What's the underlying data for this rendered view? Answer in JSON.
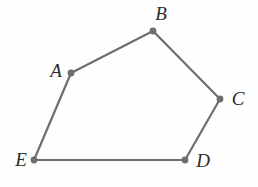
{
  "figure": {
    "type": "geometric-diagram",
    "shape_name": "pentagon",
    "background_color": "#fefefe",
    "stroke_color": "#6e6e6e",
    "vertex_dot_color": "#6e6e6e",
    "label_color": "#2b2b2b",
    "stroke_width": 2.2,
    "vertex_dot_radius": 3.4,
    "canvas": {
      "width": 258,
      "height": 187
    },
    "vertices": [
      {
        "id": "A",
        "label": "A",
        "x": 71,
        "y": 73,
        "label_x": 56,
        "label_y": 70
      },
      {
        "id": "B",
        "label": "B",
        "x": 153,
        "y": 31,
        "label_x": 161,
        "label_y": 13
      },
      {
        "id": "C",
        "label": "C",
        "x": 220,
        "y": 99,
        "label_x": 238,
        "label_y": 98
      },
      {
        "id": "D",
        "label": "D",
        "x": 185,
        "y": 160,
        "label_x": 203,
        "label_y": 160
      },
      {
        "id": "E",
        "label": "E",
        "x": 34,
        "y": 160,
        "label_x": 21,
        "label_y": 159
      }
    ],
    "edges": [
      {
        "id": "AB",
        "from": "A",
        "to": "B"
      },
      {
        "id": "BC",
        "from": "B",
        "to": "C"
      },
      {
        "id": "CD",
        "from": "C",
        "to": "D"
      },
      {
        "id": "DE",
        "from": "D",
        "to": "E"
      },
      {
        "id": "EA",
        "from": "E",
        "to": "A"
      }
    ]
  }
}
